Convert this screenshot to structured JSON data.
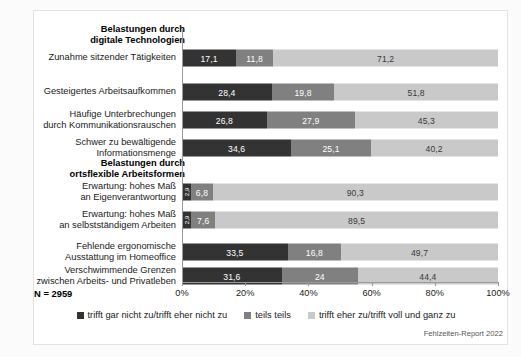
{
  "chart_data": {
    "type": "bar",
    "orientation": "horizontal",
    "stacked": true,
    "stack_total": 100,
    "title": "",
    "xlabel": "",
    "ylabel": "",
    "xlim": [
      0,
      100
    ],
    "xticks": [
      "0%",
      "20%",
      "40%",
      "60%",
      "80%",
      "100%"
    ],
    "xtick_values": [
      0,
      20,
      40,
      60,
      80,
      100
    ],
    "grid": false,
    "legend_position": "bottom-center",
    "sample_size_label": "N = 2959",
    "source_note": "Fehlzeiten-Report 2022",
    "series": [
      {
        "name": "trifft gar nicht zu/trifft eher nicht zu",
        "color": "#333333",
        "values": [
          17.1,
          28.4,
          26.8,
          34.6,
          2.9,
          2.9,
          33.5,
          31.6
        ],
        "labels": [
          "17,1",
          "28,4",
          "26,8",
          "34,6",
          "2,9",
          "2,9",
          "33,5",
          "31,6"
        ]
      },
      {
        "name": "teils teils",
        "color": "#808080",
        "values": [
          11.8,
          19.8,
          27.9,
          25.1,
          6.8,
          7.6,
          16.8,
          24.0
        ],
        "labels": [
          "11,8",
          "19,8",
          "27,9",
          "25,1",
          "6,8",
          "7,6",
          "16,8",
          "24"
        ]
      },
      {
        "name": "trifft eher zu/trifft voll und ganz zu",
        "color": "#c9c9c9",
        "values": [
          71.2,
          51.8,
          45.3,
          40.2,
          90.3,
          89.5,
          49.7,
          44.4
        ],
        "labels": [
          "71,2",
          "51,8",
          "45,3",
          "40,2",
          "90,3",
          "89,5",
          "49,7",
          "44,4"
        ]
      }
    ],
    "groups": [
      {
        "header": "Belastungen durch\ndigitale Technologien",
        "categories": [
          "Zunahme sitzender Tätigkeiten",
          "Gesteigertes Arbeitsaufkommen",
          "Häufige Unterbrechungen\ndurch Kommunikationsrauschen",
          "Schwer zu bewältigende\nInformationsmenge"
        ]
      },
      {
        "header": "Belastungen durch\nortsflexible Arbeitsformen",
        "categories": [
          "Erwartung: hohes Maß\nan Eigenverantwortung",
          "Erwartung: hohes Maß\nan selbstständigem Arbeiten",
          "Fehlende ergonomische\nAusstattung im Homeoffice",
          "Verschwimmende Grenzen\nzwischen Arbeits- und Privatleben"
        ]
      }
    ],
    "categories": [
      "Zunahme sitzender Tätigkeiten",
      "Gesteigertes Arbeitsaufkommen",
      "Häufige Unterbrechungen\ndurch Kommunikationsrauschen",
      "Schwer zu bewältigende\nInformationsmenge",
      "Erwartung: hohes Maß\nan Eigenverantwortung",
      "Erwartung: hohes Maß\nan selbstständigem Arbeiten",
      "Fehlende ergonomische\nAusstattung im Homeoffice",
      "Verschwimmende Grenzen\nzwischen Arbeits- und Privatleben"
    ]
  },
  "rows": [
    {
      "label": "Zunahme sitzender Tätigkeiten",
      "segments": [
        {
          "label": "17,1",
          "value": 17.1,
          "tone": "dark",
          "vertical": false
        },
        {
          "label": "11,8",
          "value": 11.8,
          "tone": "mid",
          "vertical": false
        },
        {
          "label": "71,2",
          "value": 71.2,
          "tone": "light",
          "vertical": false
        }
      ]
    },
    {
      "label": "Gesteigertes Arbeitsaufkommen",
      "segments": [
        {
          "label": "28,4",
          "value": 28.4,
          "tone": "dark",
          "vertical": false
        },
        {
          "label": "19,8",
          "value": 19.8,
          "tone": "mid",
          "vertical": false
        },
        {
          "label": "51,8",
          "value": 51.8,
          "tone": "light",
          "vertical": false
        }
      ]
    },
    {
      "label": "Häufige Unterbrechungen\ndurch Kommunikationsrauschen",
      "segments": [
        {
          "label": "26,8",
          "value": 26.8,
          "tone": "dark",
          "vertical": false
        },
        {
          "label": "27,9",
          "value": 27.9,
          "tone": "mid",
          "vertical": false
        },
        {
          "label": "45,3",
          "value": 45.3,
          "tone": "light",
          "vertical": false
        }
      ]
    },
    {
      "label": "Schwer zu bewältigende\nInformationsmenge",
      "segments": [
        {
          "label": "34,6",
          "value": 34.6,
          "tone": "dark",
          "vertical": false
        },
        {
          "label": "25,1",
          "value": 25.1,
          "tone": "mid",
          "vertical": false
        },
        {
          "label": "40,2",
          "value": 40.2,
          "tone": "light",
          "vertical": false
        }
      ]
    },
    {
      "label": "Erwartung: hohes Maß\nan Eigenverantwortung",
      "segments": [
        {
          "label": "2,9",
          "value": 2.9,
          "tone": "dark",
          "vertical": true
        },
        {
          "label": "6,8",
          "value": 6.8,
          "tone": "mid",
          "vertical": false
        },
        {
          "label": "90,3",
          "value": 90.3,
          "tone": "light",
          "vertical": false
        }
      ]
    },
    {
      "label": "Erwartung: hohes Maß\nan selbstständigem Arbeiten",
      "segments": [
        {
          "label": "2,9",
          "value": 2.9,
          "tone": "dark",
          "vertical": true
        },
        {
          "label": "7,6",
          "value": 7.6,
          "tone": "mid",
          "vertical": false
        },
        {
          "label": "89,5",
          "value": 89.5,
          "tone": "light",
          "vertical": false
        }
      ]
    },
    {
      "label": "Fehlende ergonomische\nAusstattung im Homeoffice",
      "segments": [
        {
          "label": "33,5",
          "value": 33.5,
          "tone": "dark",
          "vertical": false
        },
        {
          "label": "16,8",
          "value": 16.8,
          "tone": "mid",
          "vertical": false
        },
        {
          "label": "49,7",
          "value": 49.7,
          "tone": "light",
          "vertical": false
        }
      ]
    },
    {
      "label": "Verschwimmende Grenzen\nzwischen Arbeits- und Privatleben",
      "segments": [
        {
          "label": "31,6",
          "value": 31.6,
          "tone": "dark",
          "vertical": false
        },
        {
          "label": "24",
          "value": 24.0,
          "tone": "mid",
          "vertical": false
        },
        {
          "label": "44,4",
          "value": 44.4,
          "tone": "light",
          "vertical": false
        }
      ]
    }
  ],
  "group_headers": [
    "Belastungen durch\ndigitale Technologien",
    "Belastungen durch\nortsflexible Arbeitsformen"
  ],
  "axis": {
    "ticks": [
      "0%",
      "20%",
      "40%",
      "60%",
      "80%",
      "100%"
    ]
  },
  "footer": {
    "n_label": "N = 2959",
    "source": "Fehlzeiten-Report 2022"
  },
  "legend": [
    {
      "label": "trifft gar nicht zu/trifft eher nicht zu",
      "color": "#333333"
    },
    {
      "label": "teils teils",
      "color": "#808080"
    },
    {
      "label": "trifft eher zu/trifft voll und ganz zu",
      "color": "#c9c9c9"
    }
  ],
  "colors": {
    "dark": "#333333",
    "mid": "#808080",
    "light": "#c9c9c9",
    "axis": "#9a9a9a",
    "panel_border": "#e3e3e3",
    "text": "#1a1a1a"
  }
}
